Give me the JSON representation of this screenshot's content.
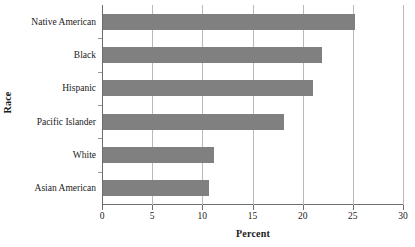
{
  "chart_data": {
    "type": "bar",
    "orientation": "horizontal",
    "title": "",
    "xlabel": "Percent",
    "ylabel": "Race",
    "categories": [
      "Native American",
      "Black",
      "Hispanic",
      "Pacific Islander",
      "White",
      "Asian American"
    ],
    "values": [
      25.1,
      21.8,
      20.9,
      18.0,
      11.1,
      10.6
    ],
    "series": [
      {
        "name": "Percent",
        "values": [
          25.1,
          21.8,
          20.9,
          18.0,
          11.1,
          10.6
        ]
      }
    ],
    "xlim": [
      0,
      30
    ],
    "xticks": [
      0,
      5,
      10,
      15,
      20,
      25,
      30
    ],
    "xtick_labels": [
      "0",
      "5",
      "10",
      "15",
      "20",
      "25",
      "30"
    ],
    "grid": true,
    "grid_axis": "x",
    "legend": false,
    "legend_position": "none",
    "bar_color": "#808080",
    "axis_color": "#6d6d6d",
    "gridline_color": "#b9b9b9",
    "background": "#ffffff"
  }
}
